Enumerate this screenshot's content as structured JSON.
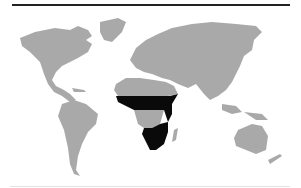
{
  "map": {
    "type": "world-choropleth",
    "colors": {
      "land": "#a9a9a9",
      "highlight": "#0a0a0a",
      "ocean": "#ffffff",
      "rule_top": "#222222",
      "rule_bottom": "#e2e2e2"
    },
    "highlighted_regions": [
      {
        "name": "sahel-east-africa-band",
        "color": "#0a0a0a"
      },
      {
        "name": "southern-africa",
        "color": "#0a0a0a"
      }
    ],
    "non_highlighted_africa_band": "central-africa"
  }
}
